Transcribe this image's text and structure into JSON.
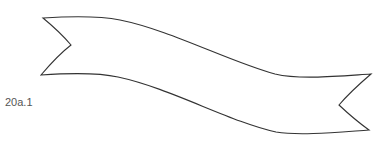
{
  "figure": {
    "label": "20a.1",
    "shape": "ribbon-banner",
    "stroke_color": "#333333",
    "fill_color": "#ffffff"
  }
}
